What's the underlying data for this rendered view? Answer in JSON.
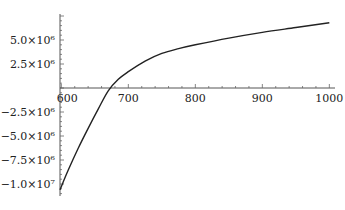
{
  "chart_data": {
    "type": "line",
    "title": "",
    "xlabel": "",
    "ylabel": "",
    "xlim": [
      590,
      1000
    ],
    "ylim": [
      -11000000,
      7500000
    ],
    "grid": false,
    "legend": null,
    "x_ticks": [
      600,
      700,
      800,
      900,
      1000
    ],
    "x_tick_labels": [
      "600",
      "700",
      "800",
      "900",
      "1000"
    ],
    "y_ticks": [
      5000000,
      2500000,
      -2500000,
      -5000000,
      -7500000,
      -10000000
    ],
    "y_tick_labels": [
      "5.0×10⁶",
      "2.5×10⁶",
      "−2.5×10⁶",
      "−5.0×10⁶",
      "−7.5×10⁶",
      "−1.0×10⁷"
    ],
    "series": [
      {
        "name": "f(x)",
        "color": "#222222",
        "x": [
          598,
          610,
          625,
          640,
          655,
          670,
          685,
          700,
          725,
          750,
          775,
          800,
          850,
          900,
          950,
          1000
        ],
        "y": [
          -10600000,
          -8600000,
          -6300000,
          -4200000,
          -2200000,
          -300000,
          900000,
          1700000,
          2800000,
          3600000,
          4100000,
          4500000,
          5200000,
          5800000,
          6300000,
          6800000
        ]
      }
    ]
  }
}
